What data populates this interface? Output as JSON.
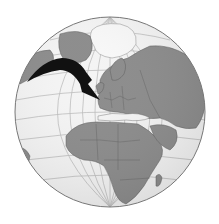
{
  "figure": {
    "view": "orthographic, centered on Europe/Africa",
    "annotation": "curved arrow from North Atlantic pointing toward Western Europe",
    "colors": {
      "background": "#ffffff",
      "ocean": "#f4f4f4",
      "land": "#8c8c8c",
      "ice": "#f8f8f8",
      "graticule": "#bdbdbd",
      "borders": "#5e5e5e",
      "arrow": "#111111",
      "outline": "#777777"
    }
  }
}
